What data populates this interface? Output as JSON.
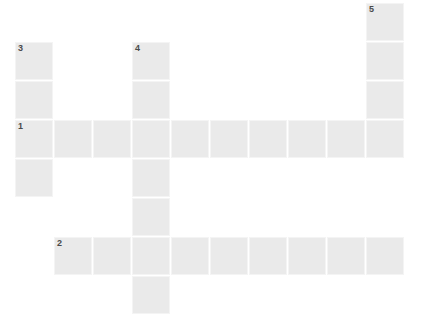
{
  "puzzle": {
    "title": "Crossword Puzzle Grid",
    "cell_size": 38,
    "cell_pitch": 39,
    "origin_x": 15,
    "origin_y": 3,
    "fill_color": "#eaeaea",
    "gap_color": "#f4f4f4",
    "number_color": "#4a4a4a",
    "background": "#ffffff",
    "clue_numbers": [
      "1",
      "2",
      "3",
      "4",
      "5"
    ],
    "cells": [
      {
        "col": 9,
        "row": 0,
        "number": "5"
      },
      {
        "col": 9,
        "row": 1,
        "number": ""
      },
      {
        "col": 9,
        "row": 2,
        "number": ""
      },
      {
        "col": 0,
        "row": 1,
        "number": "3"
      },
      {
        "col": 0,
        "row": 2,
        "number": ""
      },
      {
        "col": 0,
        "row": 3,
        "number": "1"
      },
      {
        "col": 0,
        "row": 4,
        "number": ""
      },
      {
        "col": 3,
        "row": 1,
        "number": "4"
      },
      {
        "col": 3,
        "row": 2,
        "number": ""
      },
      {
        "col": 3,
        "row": 3,
        "number": ""
      },
      {
        "col": 3,
        "row": 4,
        "number": ""
      },
      {
        "col": 3,
        "row": 5,
        "number": ""
      },
      {
        "col": 3,
        "row": 6,
        "number": ""
      },
      {
        "col": 3,
        "row": 7,
        "number": ""
      },
      {
        "col": 1,
        "row": 3,
        "number": ""
      },
      {
        "col": 2,
        "row": 3,
        "number": ""
      },
      {
        "col": 4,
        "row": 3,
        "number": ""
      },
      {
        "col": 5,
        "row": 3,
        "number": ""
      },
      {
        "col": 6,
        "row": 3,
        "number": ""
      },
      {
        "col": 7,
        "row": 3,
        "number": ""
      },
      {
        "col": 8,
        "row": 3,
        "number": ""
      },
      {
        "col": 9,
        "row": 3,
        "number": ""
      },
      {
        "col": 1,
        "row": 6,
        "number": "2"
      },
      {
        "col": 2,
        "row": 6,
        "number": ""
      },
      {
        "col": 4,
        "row": 6,
        "number": ""
      },
      {
        "col": 5,
        "row": 6,
        "number": ""
      },
      {
        "col": 6,
        "row": 6,
        "number": ""
      },
      {
        "col": 7,
        "row": 6,
        "number": ""
      },
      {
        "col": 8,
        "row": 6,
        "number": ""
      },
      {
        "col": 9,
        "row": 6,
        "number": ""
      }
    ]
  }
}
